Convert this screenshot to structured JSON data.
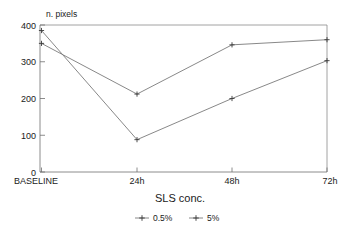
{
  "chart_data": {
    "type": "line",
    "title": "",
    "xlabel": "SLS conc.",
    "ylabel": "n. pixels",
    "categories": [
      "BASELINE",
      "24h",
      "48h",
      "72h"
    ],
    "series": [
      {
        "name": "0.5%",
        "values": [
          385,
          88,
          200,
          303
        ]
      },
      {
        "name": "5%",
        "values": [
          350,
          212,
          346,
          360
        ]
      }
    ],
    "ylim": [
      0,
      400
    ],
    "yticks": [
      0,
      100,
      200,
      300,
      400
    ],
    "ytick_labels": [
      "0",
      "100",
      "200",
      "300",
      "400"
    ],
    "xtick_labels": [
      "BASELINE",
      "24h",
      "48h",
      "72h"
    ],
    "grid": false,
    "legend_position": "bottom",
    "legend": [
      "0.5%",
      "5%"
    ],
    "marker": "plus",
    "line_color": "#7b7b7b",
    "axis_color": "#6e6e6e",
    "background": "#ffffff"
  }
}
